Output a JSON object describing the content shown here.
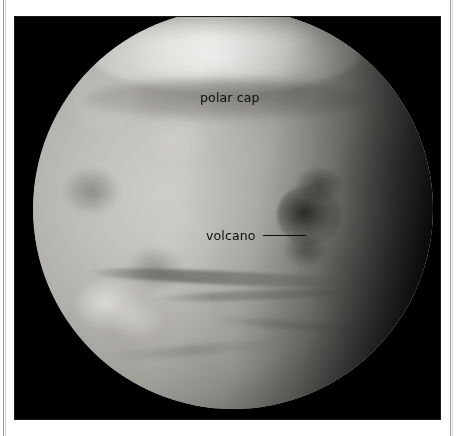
{
  "figure": {
    "running_head": "",
    "panel": {
      "background_color": "#000000",
      "description": "grayscale telescopic image of the planet Mars"
    },
    "annotations": [
      {
        "id": "polar-cap",
        "label": "polar cap",
        "has_leader_line": false,
        "text_color": "#0d0d0d"
      },
      {
        "id": "volcano",
        "label": "volcano",
        "has_leader_line": true,
        "text_color": "#0d0d0d",
        "leader_color": "#0d0d0d"
      }
    ],
    "features": [
      {
        "name": "north-polar-cap",
        "tone": "bright"
      },
      {
        "name": "polar-collar",
        "tone": "dark"
      },
      {
        "name": "volcano-complex",
        "tone": "dark"
      },
      {
        "name": "terminator",
        "tone": "shadow"
      },
      {
        "name": "southern-band",
        "tone": "dark-streak"
      },
      {
        "name": "bright-southwest-patch",
        "tone": "bright"
      }
    ],
    "frame": {
      "rule_color": "#9a9a9a",
      "page_color": "#ffffff"
    }
  }
}
